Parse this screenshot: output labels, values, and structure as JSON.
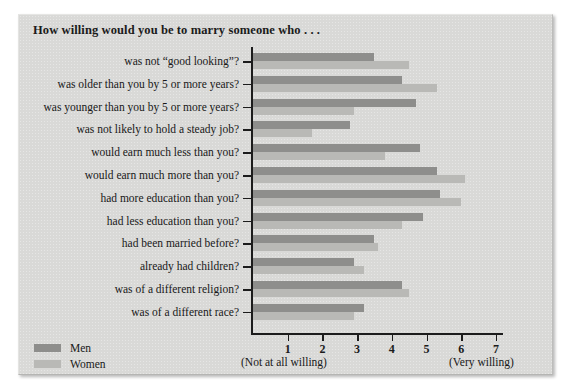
{
  "chart_title": "How willing would you be to marry someone who . . .",
  "legend": {
    "men_label": "Men",
    "women_label": "Women",
    "men_color": "#8e8e8c",
    "women_color": "#b9b9b6"
  },
  "axis": {
    "left_note": "(Not at all willing)",
    "right_note": "(Very willing)",
    "ticks": [
      "1",
      "2",
      "3",
      "4",
      "5",
      "6",
      "7"
    ]
  },
  "chart_data": {
    "type": "bar",
    "orientation": "horizontal",
    "title": "How willing would you be to marry someone who . . .",
    "xlabel": "",
    "ylabel": "",
    "xlim": [
      0,
      7.4
    ],
    "grid": false,
    "legend_position": "bottom-left",
    "xtick_labels": [
      "1",
      "2",
      "3",
      "4",
      "5",
      "6",
      "7"
    ],
    "xtick_values": [
      1,
      2,
      3,
      4,
      5,
      6,
      7
    ],
    "x_axis_anchor_left": "(Not at all willing)",
    "x_axis_anchor_right": "(Very willing)",
    "categories": [
      "was not “good looking”?",
      "was older than you by 5 or more years?",
      "was younger than you by 5 or more years?",
      "was not likely to hold a steady job?",
      "would earn much less than you?",
      "would earn much more than you?",
      "had more education than you?",
      "had less education than you?",
      "had been married before?",
      "already had children?",
      "was of a different religion?",
      "was of a different race?"
    ],
    "series": [
      {
        "name": "Men",
        "color": "#8e8e8c",
        "values": [
          3.5,
          4.3,
          4.7,
          2.8,
          4.8,
          5.3,
          5.4,
          4.9,
          3.5,
          2.9,
          4.3,
          3.2
        ]
      },
      {
        "name": "Women",
        "color": "#b9b9b6",
        "values": [
          4.5,
          5.3,
          2.9,
          1.7,
          3.8,
          6.1,
          6.0,
          4.3,
          3.6,
          3.2,
          4.5,
          2.9
        ]
      }
    ]
  }
}
